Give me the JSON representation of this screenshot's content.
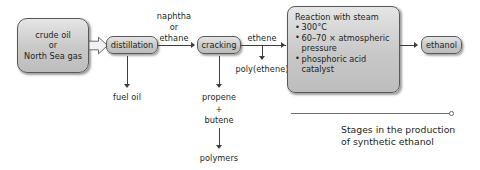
{
  "diagram": {
    "title_caption": "Stages in the production\nof synthetic ethanol",
    "nodes": {
      "source": {
        "line1": "crude oil",
        "line2": "or",
        "line3": "North Sea gas"
      },
      "distillation": "distillation",
      "cracking": "cracking",
      "ethanol": "ethanol",
      "reaction": {
        "heading": "Reaction with steam",
        "bullet1": "300°C",
        "bullet2": "60–70 × atmospheric",
        "bullet2_cont": "pressure",
        "bullet3": "phosphoric acid",
        "bullet3_cont": "catalyst"
      }
    },
    "edge_labels": {
      "naphtha_or_ethane_1": "naphtha",
      "naphtha_or_ethane_2": "or",
      "naphtha_or_ethane_3": "ethane",
      "ethene": "ethene",
      "poly_ethene": "poly(ethene)"
    },
    "outputs": {
      "fuel_oil": "fuel oil",
      "propene": "propene",
      "plus": "+",
      "butene": "butene",
      "polymers": "polymers"
    },
    "colors": {
      "box_fill_top": "#e6e6e6",
      "box_fill_bottom": "#bdbdbd",
      "box_border": "#595959",
      "text": "#231f20",
      "connector": "#3d3d3d",
      "rule": "#6e6e6e",
      "background": "#ffffff"
    }
  }
}
